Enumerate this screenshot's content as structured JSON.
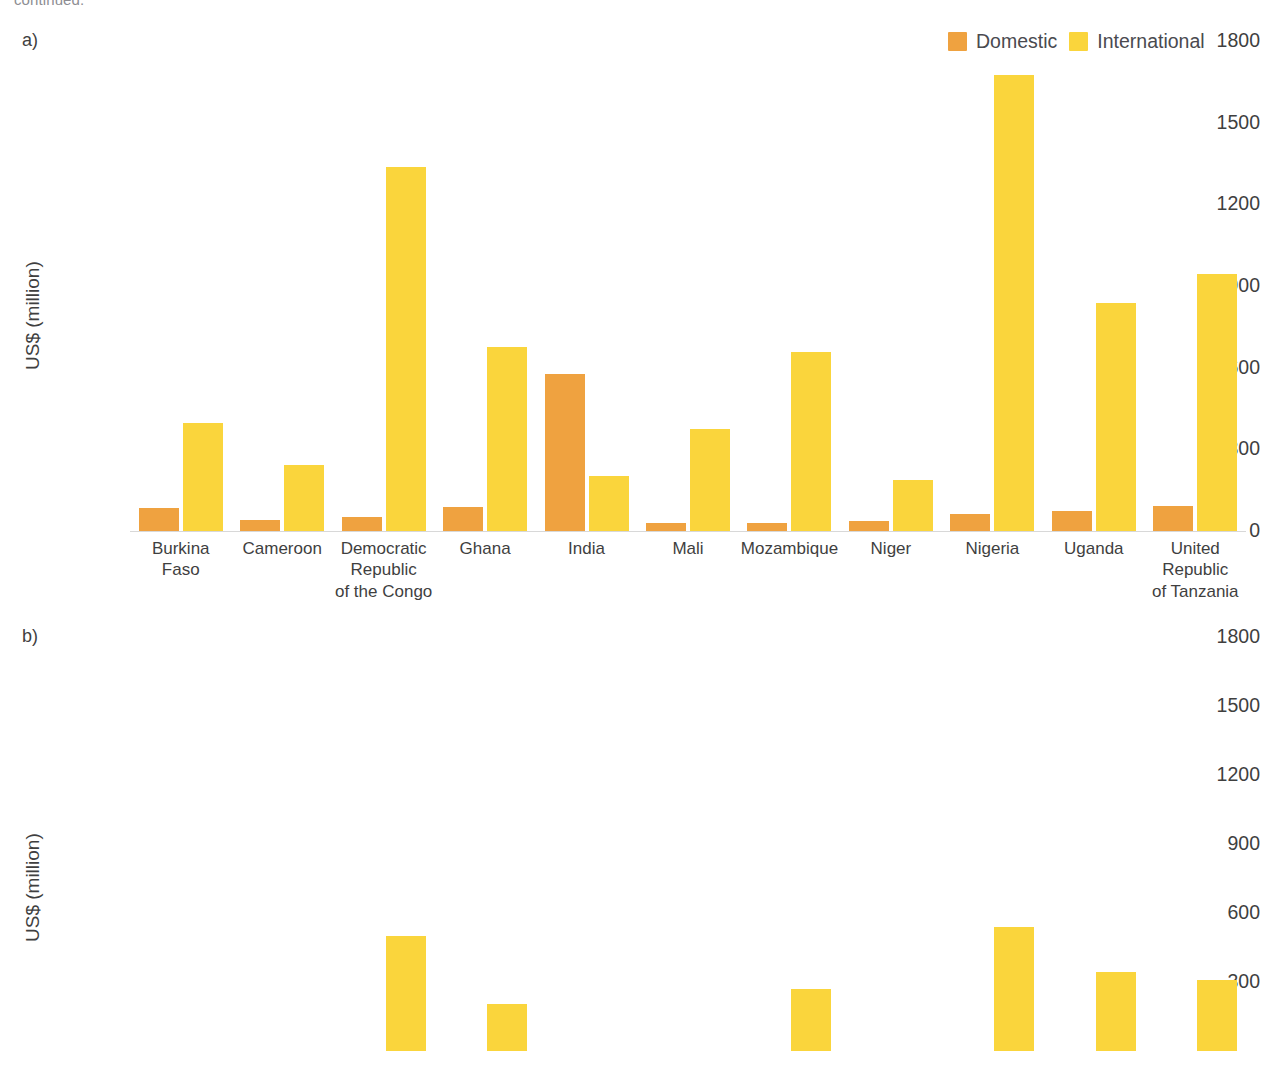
{
  "top_caption": "continued.",
  "legend": {
    "items": [
      {
        "label": "Domestic",
        "color": "#efa240",
        "icon": "legend-swatch"
      },
      {
        "label": "International",
        "color": "#fad53c",
        "icon": "legend-swatch"
      }
    ]
  },
  "panels": [
    {
      "letter": "a)",
      "ylabel": "US$ (million)"
    },
    {
      "letter": "b)",
      "ylabel": "US$ (million)"
    }
  ],
  "yticks": [
    "1800",
    "1500",
    "1200",
    "900",
    "600",
    "300",
    "0"
  ],
  "yticks_b": [
    "1800",
    "1500",
    "1200",
    "900",
    "600",
    "300"
  ],
  "chart_data": [
    {
      "type": "bar",
      "panel": "a)",
      "title": "",
      "xlabel": "",
      "ylabel": "US$ (million)",
      "ylim": [
        0,
        1800
      ],
      "yticks": [
        0,
        300,
        600,
        900,
        1200,
        1500,
        1800
      ],
      "grid": false,
      "legend_position": "top-right",
      "categories": [
        "Burkina\nFaso",
        "Cameroon",
        "Democratic\nRepublic\nof the Congo",
        "Ghana",
        "India",
        "Mali",
        "Mozambique",
        "Niger",
        "Nigeria",
        "Uganda",
        "United\nRepublic\nof Tanzania"
      ],
      "series": [
        {
          "name": "Domestic",
          "color": "#efa240",
          "values": [
            83,
            40,
            53,
            88,
            575,
            30,
            28,
            38,
            62,
            72,
            92
          ]
        },
        {
          "name": "International",
          "color": "#fad53c",
          "values": [
            396,
            243,
            1338,
            676,
            203,
            375,
            659,
            186,
            1674,
            838,
            945
          ]
        }
      ]
    },
    {
      "type": "bar",
      "panel": "b)",
      "title": "",
      "xlabel": "",
      "ylabel": "US$ (million)",
      "ylim": [
        0,
        1800
      ],
      "yticks": [
        300,
        600,
        900,
        1200,
        1500,
        1800
      ],
      "grid": false,
      "legend_position": "none",
      "note": "panel cropped at bottom of screenshot; only International bars visible",
      "categories": [
        "Burkina\nFaso",
        "Cameroon",
        "Democratic\nRepublic\nof the Congo",
        "Ghana",
        "India",
        "Mali",
        "Mozambique",
        "Niger",
        "Nigeria",
        "Uganda",
        "United\nRepublic\nof Tanzania"
      ],
      "series": [
        {
          "name": "Domestic",
          "color": "#efa240",
          "values": [
            0,
            0,
            0,
            0,
            0,
            0,
            0,
            0,
            0,
            0,
            0
          ]
        },
        {
          "name": "International",
          "color": "#fad53c",
          "values": [
            0,
            0,
            500,
            205,
            0,
            0,
            270,
            0,
            540,
            345,
            310
          ]
        }
      ]
    }
  ]
}
